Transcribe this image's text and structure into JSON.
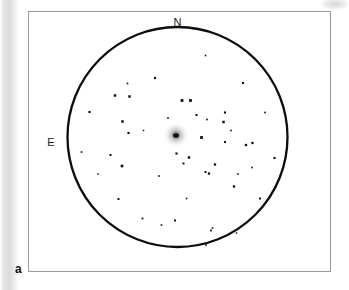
{
  "figure": {
    "panel_label": "a",
    "width": 349,
    "height": 290,
    "background_color": "#ffffff",
    "frame_color": "#9a9a9a"
  },
  "orientation_labels": {
    "north": "N",
    "east": "E"
  },
  "chart_data": {
    "type": "scatter",
    "title": "",
    "subtitle": "",
    "xlabel": "",
    "ylabel": "",
    "grid": false,
    "legend_position": "none",
    "annotations": [
      {
        "label": "N",
        "x": 177.5,
        "y": 22,
        "meaning": "north direction marker at top of field"
      },
      {
        "label": "E",
        "x": 51,
        "y": 142,
        "meaning": "east direction marker at left of field"
      },
      {
        "label": "a",
        "x": 20,
        "y": 269,
        "meaning": "panel identifier"
      }
    ],
    "field_of_view_circle": {
      "center_x": 177.5,
      "center_y": 137.0,
      "radius": 110.0,
      "stroke_color": "#0d0d0d",
      "stroke_width": 2.3,
      "fill": "none"
    },
    "extended_source": {
      "name": "central-galaxy",
      "x": 176.0,
      "y": 135.0,
      "halo_radius": 13.5,
      "core_radius": 2.6,
      "core_color": "#141414",
      "halo_color": "#b4b4b4"
    },
    "series": [
      {
        "name": "point-sources",
        "marker": "square",
        "color": "#111111",
        "count": 48,
        "points": [
          {
            "x": 205.5,
            "y": 55.5,
            "r": 1.0
          },
          {
            "x": 155.0,
            "y": 78.0,
            "r": 1.3
          },
          {
            "x": 243.0,
            "y": 83.0,
            "r": 1.3
          },
          {
            "x": 127.5,
            "y": 83.5,
            "r": 1.0
          },
          {
            "x": 115.0,
            "y": 95.5,
            "r": 1.5
          },
          {
            "x": 129.5,
            "y": 96.5,
            "r": 1.5
          },
          {
            "x": 182.0,
            "y": 100.5,
            "r": 1.7
          },
          {
            "x": 190.5,
            "y": 100.5,
            "r": 1.7
          },
          {
            "x": 89.5,
            "y": 112.0,
            "r": 1.3
          },
          {
            "x": 265.0,
            "y": 112.5,
            "r": 1.0
          },
          {
            "x": 122.5,
            "y": 121.5,
            "r": 1.5
          },
          {
            "x": 196.5,
            "y": 115.0,
            "r": 1.2
          },
          {
            "x": 225.0,
            "y": 112.5,
            "r": 1.3
          },
          {
            "x": 207.0,
            "y": 119.5,
            "r": 1.0
          },
          {
            "x": 223.5,
            "y": 122.0,
            "r": 1.5
          },
          {
            "x": 128.5,
            "y": 133.0,
            "r": 1.3
          },
          {
            "x": 201.5,
            "y": 137.5,
            "r": 1.7
          },
          {
            "x": 225.0,
            "y": 142.0,
            "r": 1.2
          },
          {
            "x": 246.0,
            "y": 145.0,
            "r": 1.4
          },
          {
            "x": 252.5,
            "y": 143.0,
            "r": 1.4
          },
          {
            "x": 81.5,
            "y": 152.0,
            "r": 1.0
          },
          {
            "x": 110.5,
            "y": 155.0,
            "r": 1.2
          },
          {
            "x": 189.0,
            "y": 157.5,
            "r": 1.5
          },
          {
            "x": 183.5,
            "y": 163.5,
            "r": 1.2
          },
          {
            "x": 274.5,
            "y": 158.0,
            "r": 1.3
          },
          {
            "x": 122.0,
            "y": 166.0,
            "r": 1.6
          },
          {
            "x": 215.0,
            "y": 164.5,
            "r": 1.4
          },
          {
            "x": 205.5,
            "y": 172.0,
            "r": 1.2
          },
          {
            "x": 209.0,
            "y": 173.5,
            "r": 1.4
          },
          {
            "x": 176.5,
            "y": 153.5,
            "r": 1.3
          },
          {
            "x": 234.0,
            "y": 186.5,
            "r": 1.4
          },
          {
            "x": 186.5,
            "y": 198.5,
            "r": 1.0
          },
          {
            "x": 118.5,
            "y": 199.0,
            "r": 1.2
          },
          {
            "x": 260.0,
            "y": 198.5,
            "r": 1.2
          },
          {
            "x": 238.0,
            "y": 174.0,
            "r": 1.0
          },
          {
            "x": 212.5,
            "y": 228.0,
            "r": 1.0
          },
          {
            "x": 211.0,
            "y": 230.5,
            "r": 1.1
          },
          {
            "x": 142.5,
            "y": 218.5,
            "r": 1.1
          },
          {
            "x": 175.0,
            "y": 220.5,
            "r": 1.2
          },
          {
            "x": 161.5,
            "y": 225.0,
            "r": 1.0
          },
          {
            "x": 236.5,
            "y": 233.0,
            "r": 0.9
          },
          {
            "x": 206.0,
            "y": 245.0,
            "r": 1.0
          },
          {
            "x": 143.5,
            "y": 130.5,
            "r": 0.9
          },
          {
            "x": 231.0,
            "y": 130.5,
            "r": 1.0
          },
          {
            "x": 159.0,
            "y": 176.0,
            "r": 1.0
          },
          {
            "x": 98.0,
            "y": 174.0,
            "r": 0.9
          },
          {
            "x": 252.0,
            "y": 167.5,
            "r": 1.0
          },
          {
            "x": 168.0,
            "y": 118.0,
            "r": 1.0
          }
        ]
      }
    ]
  }
}
